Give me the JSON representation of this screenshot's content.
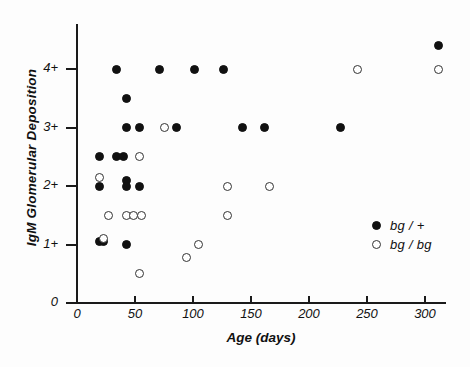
{
  "chart_data": {
    "type": "scatter",
    "title": "",
    "xlabel": "Age (days)",
    "ylabel": "IgM Glomerular Deposition",
    "xlim": [
      0,
      320
    ],
    "ylim": [
      0,
      4.75
    ],
    "grid": false,
    "legend_position": "inside-right",
    "xticks": [
      0,
      50,
      100,
      150,
      200,
      250,
      300
    ],
    "xtick_labels": [
      "0",
      "50",
      "100",
      "150",
      "200",
      "250",
      "300"
    ],
    "yticks": [
      0,
      1,
      2,
      3,
      4
    ],
    "ytick_labels": [
      "0",
      "1+",
      "2+",
      "3+",
      "4+"
    ],
    "series": [
      {
        "name": "bg/+",
        "marker": "filled-circle",
        "color": "#111111",
        "points": [
          [
            312,
            4.4
          ],
          [
            34,
            4.0
          ],
          [
            71,
            4.0
          ],
          [
            101,
            4.0
          ],
          [
            126,
            4.0
          ],
          [
            43,
            3.5
          ],
          [
            43,
            3.0
          ],
          [
            54,
            3.0
          ],
          [
            86,
            3.0
          ],
          [
            143,
            3.0
          ],
          [
            162,
            3.0
          ],
          [
            227,
            3.0
          ],
          [
            19,
            2.5
          ],
          [
            34,
            2.5
          ],
          [
            40,
            2.5
          ],
          [
            19,
            2.0
          ],
          [
            43,
            2.1
          ],
          [
            43,
            2.0
          ],
          [
            54,
            2.0
          ],
          [
            19,
            1.05
          ],
          [
            23,
            1.05
          ],
          [
            43,
            1.0
          ]
        ]
      },
      {
        "name": "bg/bg",
        "marker": "open-circle",
        "color": "#333333",
        "points": [
          [
            242,
            4.0
          ],
          [
            312,
            4.0
          ],
          [
            75,
            3.0
          ],
          [
            54,
            2.5
          ],
          [
            19,
            2.15
          ],
          [
            130,
            2.0
          ],
          [
            166,
            2.0
          ],
          [
            27,
            1.5
          ],
          [
            43,
            1.5
          ],
          [
            49,
            1.5
          ],
          [
            56,
            1.5
          ],
          [
            130,
            1.5
          ],
          [
            23,
            1.1
          ],
          [
            105,
            1.0
          ],
          [
            94,
            0.78
          ],
          [
            54,
            0.5
          ]
        ]
      }
    ]
  },
  "legend": {
    "items": [
      {
        "label": "bg / +",
        "marker": "filled"
      },
      {
        "label": "bg / bg",
        "marker": "open"
      }
    ]
  }
}
